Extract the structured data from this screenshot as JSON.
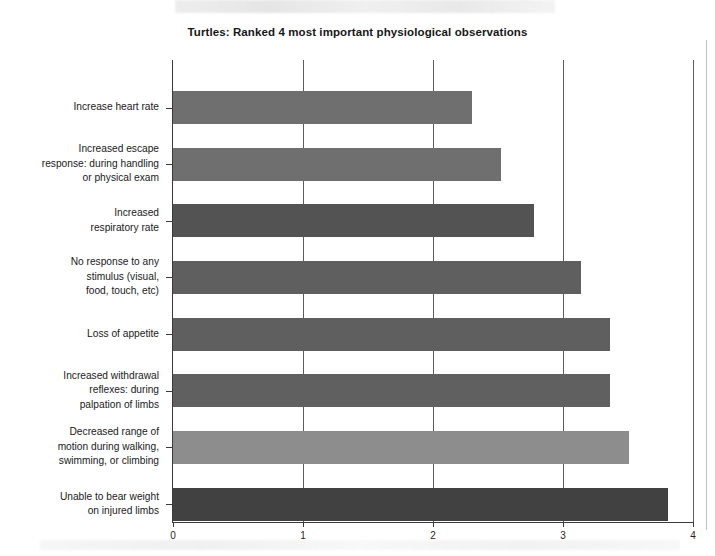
{
  "chart_data": {
    "type": "bar",
    "orientation": "horizontal",
    "title": "Turtles: Ranked 4 most important physiological observations",
    "xlabel": "",
    "ylabel": "",
    "xlim": [
      0,
      4
    ],
    "xticks": [
      "0",
      "1",
      "2",
      "3",
      "4"
    ],
    "grid": true,
    "legend": "none",
    "categories": [
      "Increase heart rate",
      "Increased escape\nresponse: during handling\nor physical exam",
      "Increased\nrespiratory rate",
      "No response to any\nstimulus (visual,\nfood, touch, etc)",
      "Loss of appetite",
      "Increased withdrawal\nreflexes: during\npalpation of limbs",
      "Decreased range of\nmotion during walking,\nswimming, or climbing",
      "Unable to bear weight\non injured limbs"
    ],
    "values": [
      2.3,
      2.52,
      2.78,
      3.14,
      3.36,
      3.36,
      3.51,
      3.81
    ],
    "bar_colors": [
      "#6f6f6f",
      "#6f6f6f",
      "#535353",
      "#5f5f5f",
      "#5f5f5f",
      "#606060",
      "#8d8d8d",
      "#414141"
    ]
  },
  "axis": {
    "x_tick_labels": [
      "0",
      "1",
      "2",
      "3",
      "4"
    ]
  }
}
